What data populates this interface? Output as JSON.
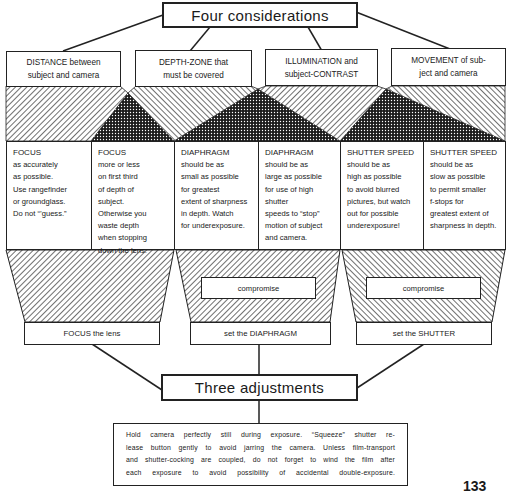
{
  "title": "Four considerations",
  "considerations": [
    {
      "lines": [
        "DISTANCE between",
        "subject and camera"
      ]
    },
    {
      "lines": [
        "DEPTH-ZONE that",
        "must be covered"
      ]
    },
    {
      "lines": [
        "ILLUMINATION and",
        "subject-CONTRAST"
      ]
    },
    {
      "lines": [
        "MOVEMENT of sub-",
        "ject and camera"
      ]
    }
  ],
  "columns": [
    {
      "heading": "FOCUS",
      "lines": [
        "as accurately",
        "as possible.",
        "Use rangefinder",
        "or groundglass.",
        "Do not “’guess.”"
      ]
    },
    {
      "heading": "FOCUS",
      "lines": [
        "more or less",
        "on first third",
        "of depth of",
        "subject.",
        "Otherwise you",
        "waste depth",
        "when stopping",
        "down the lens."
      ]
    },
    {
      "heading": "DIAPHRAGM",
      "lines": [
        "should be as",
        "small as possible",
        "for greatest",
        "extent of sharpness",
        "in depth. Watch",
        "for underexposure."
      ]
    },
    {
      "heading": "DIAPHRAGM",
      "lines": [
        "should be as",
        "large as possible",
        "for use of high",
        "shutter",
        "speeds to “stop”",
        "motion of subject",
        "and camera."
      ]
    },
    {
      "heading": "SHUTTER SPEED",
      "lines": [
        "should be as",
        "high as possible",
        "to avoid blurred",
        "pictures, but watch",
        "out for possible",
        "underexposure!"
      ]
    },
    {
      "heading": "SHUTTER SPEED",
      "lines": [
        "should be as",
        "slow as possible",
        "to permit smaller",
        "f-stops for",
        "greatest extent of",
        "sharpness in depth."
      ]
    }
  ],
  "compromise": [
    "compromise",
    "compromise"
  ],
  "adjustments": [
    "FOCUS the lens",
    "set the DIAPHRAGM",
    "set the SHUTTER"
  ],
  "subtitle": "Three adjustments",
  "note": {
    "lines": [
      "Hold camera perfectly still during exposure. “Squeeze” shutter re-",
      "lease button gently to avoid jarring the camera. Unless film-transport",
      "and shutter-cocking are coupled, do not forget to wind the film after",
      "each exposure to avoid possibility of accidental double-exposure."
    ]
  },
  "page_number": "133",
  "colors": {
    "ink": "#1a1a1a",
    "paper": "#ffffff"
  }
}
